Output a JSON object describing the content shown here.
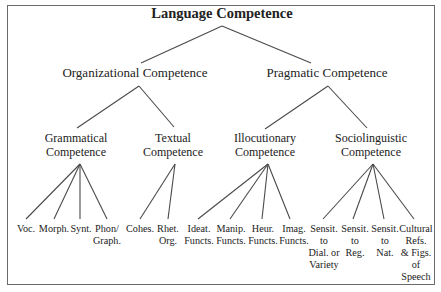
{
  "diagram": {
    "type": "tree",
    "root": {
      "label": "Language Competence",
      "children": [
        {
          "label": "Organizational Competence",
          "children": [
            {
              "label_lines": [
                "Grammatical",
                "Competence"
              ],
              "children": [
                {
                  "lines": [
                    "Voc."
                  ]
                },
                {
                  "lines": [
                    "Morph."
                  ]
                },
                {
                  "lines": [
                    "Synt."
                  ]
                },
                {
                  "lines": [
                    "Phon/",
                    "Graph."
                  ]
                }
              ]
            },
            {
              "label_lines": [
                "Textual",
                "Competence"
              ],
              "children": [
                {
                  "lines": [
                    "Cohes."
                  ]
                },
                {
                  "lines": [
                    "Rhet.",
                    "Org."
                  ]
                }
              ]
            }
          ]
        },
        {
          "label": "Pragmatic Competence",
          "children": [
            {
              "label_lines": [
                "Illocutionary",
                "Competence"
              ],
              "children": [
                {
                  "lines": [
                    "Ideat.",
                    "Functs."
                  ]
                },
                {
                  "lines": [
                    "Manip.",
                    "Functs."
                  ]
                },
                {
                  "lines": [
                    "Heur.",
                    "Functs."
                  ]
                },
                {
                  "lines": [
                    "Imag.",
                    "Functs."
                  ]
                }
              ]
            },
            {
              "label_lines": [
                "Sociolinguistic",
                "Competence"
              ],
              "children": [
                {
                  "lines": [
                    "Sensit.",
                    "to",
                    "Dial. or",
                    "Variety"
                  ]
                },
                {
                  "lines": [
                    "Sensit.",
                    "to",
                    "Reg."
                  ]
                },
                {
                  "lines": [
                    "Sensit.",
                    "to",
                    "Nat."
                  ]
                },
                {
                  "lines": [
                    "Cultural",
                    "Refs.",
                    "& Figs.",
                    "of",
                    "Speech"
                  ]
                }
              ]
            }
          ]
        }
      ]
    }
  },
  "colors": {
    "line": "#4a4a4a",
    "frame": "#6a6a6a",
    "text": "#222222",
    "background": "#ffffff"
  }
}
